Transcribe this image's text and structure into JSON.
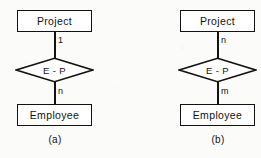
{
  "figure": {
    "background_color": "#fbfbfa",
    "line_color": "#121212",
    "diagrams": [
      {
        "id": "a",
        "caption": "(a)",
        "top_entity": "Project",
        "bottom_entity": "Employee",
        "relationship": "E - P",
        "top_cardinality": "1",
        "bottom_cardinality": "n"
      },
      {
        "id": "b",
        "caption": "(b)",
        "top_entity": "Project",
        "bottom_entity": "Employee",
        "relationship": "E - P",
        "top_cardinality": "n",
        "bottom_cardinality": "m"
      }
    ]
  }
}
